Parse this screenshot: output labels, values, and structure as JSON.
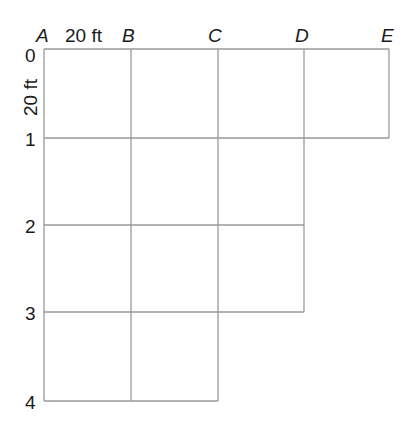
{
  "diagram": {
    "column_labels": [
      "A",
      "B",
      "C",
      "D",
      "E"
    ],
    "row_labels": [
      "0",
      "1",
      "2",
      "3",
      "4"
    ],
    "horizontal_scale_label": "20 ft",
    "vertical_scale_label": "20 ft",
    "cell_size": "20 ft",
    "cells_per_row": [
      4,
      3,
      3,
      2
    ],
    "line_color": "#9a9a9a"
  }
}
